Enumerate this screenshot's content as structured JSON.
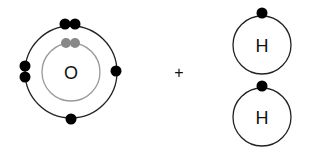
{
  "diagram": {
    "type": "bohr-model-reactants",
    "oxygen": {
      "symbol": "O",
      "inner_shell_electrons": 2,
      "outer_shell_electrons": 6
    },
    "operator": "+",
    "hydrogen_atoms": [
      {
        "symbol": "H",
        "electrons": 1
      },
      {
        "symbol": "H",
        "electrons": 1
      }
    ],
    "colors": {
      "shell": "#222222",
      "inner_shell": "#999999",
      "electron": "#000000",
      "inner_electron": "#888888",
      "background": "#ffffff"
    }
  }
}
